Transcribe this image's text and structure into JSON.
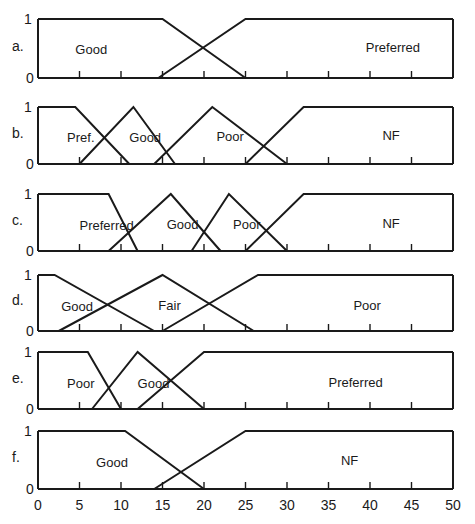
{
  "chart_data": {
    "type": "line",
    "title": "",
    "xlabel": "",
    "ylabel": "",
    "xlim": [
      0,
      50
    ],
    "ylim": [
      0,
      1
    ],
    "x_ticks": [
      0,
      5,
      10,
      15,
      20,
      25,
      30,
      35,
      40,
      45,
      50
    ],
    "y_ticks": [
      0,
      1
    ],
    "grid": false,
    "legend": "none (labels inside panels)",
    "panels": [
      {
        "label": "a.",
        "sets": [
          {
            "name": "Good",
            "points": [
              [
                0,
                1
              ],
              [
                15,
                1
              ],
              [
                25,
                0
              ]
            ],
            "label_x": 4.5,
            "label_y": 0.5
          },
          {
            "name": "Preferred",
            "points": [
              [
                14.5,
                0
              ],
              [
                25,
                1
              ],
              [
                50,
                1
              ]
            ],
            "label_x": 39.5,
            "label_y": 0.53
          }
        ]
      },
      {
        "label": "b.",
        "sets": [
          {
            "name": "Pref.",
            "points": [
              [
                0,
                1
              ],
              [
                4.5,
                1
              ],
              [
                11,
                0
              ]
            ],
            "label_x": 3.5,
            "label_y": 0.47
          },
          {
            "name": "Good",
            "points": [
              [
                5,
                0
              ],
              [
                11.5,
                1
              ],
              [
                16.5,
                0
              ]
            ],
            "label_x": 11,
            "label_y": 0.48
          },
          {
            "name": "Poor",
            "points": [
              [
                14,
                0
              ],
              [
                21,
                1
              ],
              [
                30,
                0
              ]
            ],
            "label_x": 21.5,
            "label_y": 0.49
          },
          {
            "name": "NF",
            "points": [
              [
                25,
                0
              ],
              [
                32,
                1
              ],
              [
                50,
                1
              ]
            ],
            "label_x": 41.5,
            "label_y": 0.51
          }
        ]
      },
      {
        "label": "c.",
        "sets": [
          {
            "name": "Preferred",
            "points": [
              [
                0,
                1
              ],
              [
                8.5,
                1
              ],
              [
                12,
                0
              ]
            ],
            "label_x": 5,
            "label_y": 0.46
          },
          {
            "name": "Good",
            "points": [
              [
                8.5,
                0
              ],
              [
                16,
                1
              ],
              [
                22,
                0
              ]
            ],
            "label_x": 15.5,
            "label_y": 0.48
          },
          {
            "name": "Poor",
            "points": [
              [
                18.5,
                0
              ],
              [
                23,
                1
              ],
              [
                30,
                0
              ]
            ],
            "label_x": 23.5,
            "label_y": 0.48
          },
          {
            "name": "NF",
            "points": [
              [
                25,
                0
              ],
              [
                32,
                1
              ],
              [
                50,
                1
              ]
            ],
            "label_x": 41.5,
            "label_y": 0.5
          }
        ]
      },
      {
        "label": "d.",
        "sets": [
          {
            "name": "Good",
            "points": [
              [
                0,
                1
              ],
              [
                2,
                1
              ],
              [
                14,
                0
              ]
            ],
            "label_x": 2.8,
            "label_y": 0.45
          },
          {
            "name": "Fair",
            "points": [
              [
                2.5,
                0
              ],
              [
                15,
                1
              ],
              [
                26,
                0
              ]
            ],
            "label_x": 14.5,
            "label_y": 0.46
          },
          {
            "name": "Poor",
            "points": [
              [
                15,
                0
              ],
              [
                26.5,
                1
              ],
              [
                50,
                1
              ]
            ],
            "label_x": 38,
            "label_y": 0.47
          }
        ]
      },
      {
        "label": "e.",
        "sets": [
          {
            "name": "Poor",
            "points": [
              [
                0,
                1
              ],
              [
                6,
                1
              ],
              [
                10,
                0
              ]
            ],
            "label_x": 3.5,
            "label_y": 0.45
          },
          {
            "name": "Good",
            "points": [
              [
                6.5,
                0
              ],
              [
                12,
                1
              ],
              [
                20,
                0
              ]
            ],
            "label_x": 12,
            "label_y": 0.46
          },
          {
            "name": "Preferred",
            "points": [
              [
                12,
                0
              ],
              [
                20,
                1
              ],
              [
                50,
                1
              ]
            ],
            "label_x": 35,
            "label_y": 0.48
          }
        ]
      },
      {
        "label": "f.",
        "sets": [
          {
            "name": "Good",
            "points": [
              [
                0,
                1
              ],
              [
                10.5,
                1
              ],
              [
                20,
                0
              ]
            ],
            "label_x": 7,
            "label_y": 0.47
          },
          {
            "name": "NF",
            "points": [
              [
                14,
                0
              ],
              [
                25,
                1
              ],
              [
                50,
                1
              ]
            ],
            "label_x": 36.5,
            "label_y": 0.5
          }
        ]
      }
    ]
  },
  "layout": {
    "x0_px": 38,
    "x50_px": 453,
    "panel_px": [
      {
        "top": 19,
        "bottom": 78
      },
      {
        "top": 107,
        "bottom": 164
      },
      {
        "top": 194,
        "bottom": 251
      },
      {
        "top": 275,
        "bottom": 331
      },
      {
        "top": 352,
        "bottom": 409
      },
      {
        "top": 431,
        "bottom": 489
      }
    ],
    "stroke_color": "#1a1a1a",
    "background": "#ffffff"
  }
}
